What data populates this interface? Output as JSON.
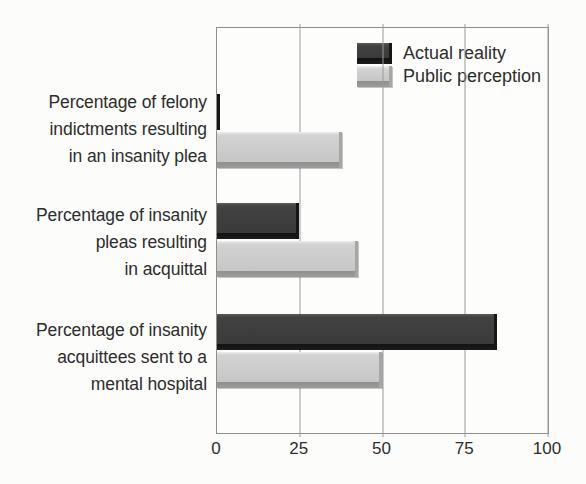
{
  "chart_data": {
    "type": "bar",
    "orientation": "horizontal",
    "title": "",
    "categories": [
      "Percentage of felony\nindictments resulting\nin an insanity plea",
      "Percentage of insanity\npleas resulting\nin acquittal",
      "Percentage of insanity\nacquittees sent to a\nmental hospital"
    ],
    "series": [
      {
        "name": "Actual reality",
        "color": "#3a3a3a",
        "values": [
          1,
          25,
          85
        ]
      },
      {
        "name": "Public perception",
        "color": "#c6c6c6",
        "values": [
          38,
          43,
          50
        ]
      }
    ],
    "xlabel": "",
    "ylabel": "",
    "xlim": [
      0,
      100
    ],
    "xticks": [
      0,
      25,
      50,
      75,
      100
    ],
    "grid": true,
    "legend_position": "top-right"
  },
  "colors": {
    "background": "#fcfcfa",
    "text": "#2d2d2d",
    "frame": "#8e8e8e",
    "gridline": "#9a9a9a",
    "bar_dark": "#3a3a3a",
    "bar_light": "#c6c6c6"
  }
}
